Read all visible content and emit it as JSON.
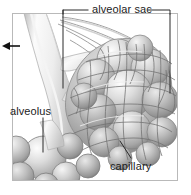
{
  "figure": {
    "kind": "anatomical-illustration",
    "style": "grayscale pencil/airbrush medical drawing",
    "frame": {
      "border_color": "#b9b9b9",
      "background": "#ffffff"
    },
    "width": 191,
    "height": 195
  },
  "labels": {
    "alveolar_sac": "alveolar sac",
    "alveolus": "alveolus",
    "capillary": "capillary"
  },
  "leaders": {
    "alveolar_sac_bracket": "horizontal bracket with downward tick on left and right ends",
    "alveolus_line": "vertical line from label down into smooth alveolus sphere",
    "capillary_line": "diagonal line from label up-left into capillary mesh"
  },
  "markers": {
    "inflow_arrow": "left-pointing arrow at left edge indicating airflow direction",
    "arrow_color": "#111111"
  },
  "colors": {
    "ink": "#1c1c1c",
    "leader": "#2a2a2a",
    "frame": "#b9b9b9",
    "tissue_light": "#f2f2f2",
    "tissue_mid": "#c6c6c6",
    "tissue_dark": "#8f8f8f",
    "mesh_line": "#6f6f6f",
    "duct_light": "#fafafa",
    "duct_shadow": "#bdbdbd"
  }
}
